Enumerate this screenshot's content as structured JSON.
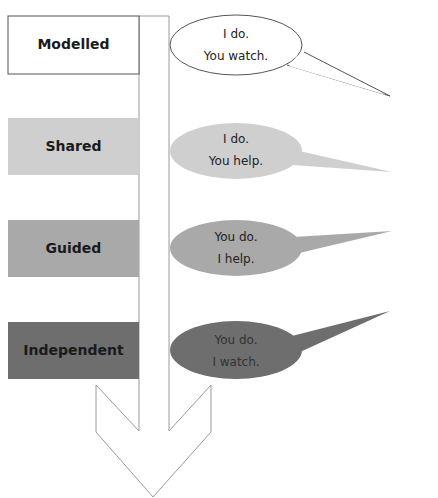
{
  "diagram": {
    "type": "gradual-release-of-responsibility",
    "arrow": {
      "direction": "down",
      "color": "#ffffff",
      "stroke": "#9a9a9a"
    },
    "stages": [
      {
        "label": "Modelled",
        "fill": "#ffffff",
        "line1": "I do.",
        "line2": "You watch.",
        "bubble_fill": "#ffffff"
      },
      {
        "label": "Shared",
        "fill": "#cfcfcf",
        "line1": "I do.",
        "line2": "You help.",
        "bubble_fill": "#cfcfcf"
      },
      {
        "label": "Guided",
        "fill": "#a9a9a9",
        "line1": "You do.",
        "line2": "I help.",
        "bubble_fill": "#a9a9a9"
      },
      {
        "label": "Independent",
        "fill": "#6e6e6e",
        "line1": "You do.",
        "line2": "I watch.",
        "bubble_fill": "#6e6e6e"
      }
    ]
  }
}
